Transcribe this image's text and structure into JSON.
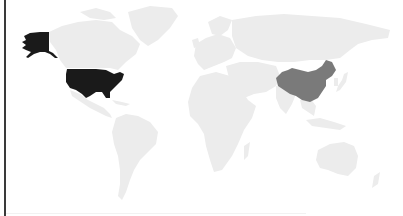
{
  "map": {
    "type": "choropleth-world-map",
    "colors": {
      "background": "#ffffff",
      "default_land": "#ececec",
      "high": "#1a1a1a",
      "medium": "#7a7a7a",
      "border": "#3a3a3a"
    },
    "highlighted_regions": [
      {
        "name": "United States",
        "shade": "high",
        "color": "#1a1a1a"
      },
      {
        "name": "Alaska (United States)",
        "shade": "high",
        "color": "#1a1a1a"
      },
      {
        "name": "China",
        "shade": "medium",
        "color": "#7a7a7a"
      }
    ]
  }
}
